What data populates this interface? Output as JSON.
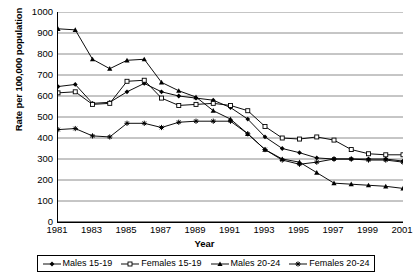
{
  "chart_data": {
    "type": "line",
    "title": "",
    "xlabel": "Year",
    "ylabel": "Rate per 100,000 population",
    "xlim": [
      1981,
      2001
    ],
    "ylim": [
      0,
      1000
    ],
    "ytick_step": 100,
    "grid": true,
    "legend_position": "bottom",
    "x": [
      1981,
      1982,
      1983,
      1984,
      1985,
      1986,
      1987,
      1988,
      1989,
      1990,
      1991,
      1992,
      1993,
      1994,
      1995,
      1996,
      1997,
      1998,
      1999,
      2000,
      2001
    ],
    "xtick_labels": [
      "1981",
      "1983",
      "1985",
      "1987",
      "1989",
      "1991",
      "1993",
      "1995",
      "1997",
      "1999",
      "2001"
    ],
    "ytick_labels": [
      "0",
      "100",
      "200",
      "300",
      "400",
      "500",
      "600",
      "700",
      "800",
      "900",
      "1000"
    ],
    "series": [
      {
        "name": "Males 15-19",
        "marker": "filled-diamond",
        "color": "#000000",
        "values": [
          645,
          655,
          565,
          570,
          620,
          660,
          620,
          600,
          590,
          580,
          545,
          490,
          405,
          350,
          330,
          305,
          300,
          300,
          300,
          300,
          290
        ]
      },
      {
        "name": "Females 15-19",
        "marker": "open-square",
        "color": "#000000",
        "values": [
          615,
          620,
          560,
          565,
          670,
          675,
          590,
          555,
          560,
          565,
          555,
          530,
          455,
          400,
          395,
          405,
          390,
          345,
          325,
          320,
          320
        ]
      },
      {
        "name": "Males 20-24",
        "marker": "filled-triangle",
        "color": "#000000",
        "values": [
          920,
          915,
          775,
          730,
          770,
          775,
          665,
          625,
          595,
          530,
          490,
          420,
          345,
          300,
          285,
          235,
          185,
          180,
          175,
          170,
          160
        ]
      },
      {
        "name": "Females 20-24",
        "marker": "filled-plus",
        "color": "#000000",
        "values": [
          440,
          445,
          410,
          405,
          470,
          470,
          450,
          475,
          480,
          480,
          480,
          420,
          345,
          295,
          275,
          285,
          300,
          300,
          295,
          295,
          285
        ]
      }
    ]
  },
  "legend": {
    "items": [
      {
        "label": "Males 15-19",
        "marker": "filled-diamond"
      },
      {
        "label": "Females 15-19",
        "marker": "open-square"
      },
      {
        "label": "Males 20-24",
        "marker": "filled-triangle"
      },
      {
        "label": "Females 20-24",
        "marker": "filled-plus"
      }
    ]
  }
}
